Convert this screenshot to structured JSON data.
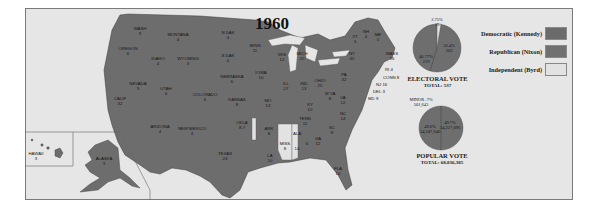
{
  "title": "1960",
  "legend": {
    "items": [
      {
        "label": "Democratic (Kennedy)",
        "color": "#6b6b6b"
      },
      {
        "label": "Republican (Nixon)",
        "color": "#707070"
      },
      {
        "label": "Independent (Byrd)",
        "color": "#e2e2e2"
      }
    ]
  },
  "electoral_vote": {
    "heading": "ELECTORAL VOTE",
    "total_label": "TOTAL: 537",
    "slices": [
      {
        "party": "Independent",
        "percent": "2.75%",
        "votes": "15"
      },
      {
        "party": "Democratic",
        "percent": "56.4%",
        "votes": "303"
      },
      {
        "party": "Republican",
        "percent": "40.77%",
        "votes": "219"
      }
    ]
  },
  "popular_vote": {
    "heading": "POPULAR VOTE",
    "total_label": "TOTAL: 68,836,385",
    "minor_label": "MINOR .7%",
    "minor_votes": "501,643",
    "slices": [
      {
        "party": "Democratic",
        "percent": "49.7%",
        "votes": "34,227,096"
      },
      {
        "party": "Republican",
        "percent": "49.6%",
        "votes": "34,107,646"
      }
    ]
  },
  "states": [
    {
      "name": "WASH",
      "ev": "9"
    },
    {
      "name": "OREGON",
      "ev": "6"
    },
    {
      "name": "CALIF",
      "ev": "32"
    },
    {
      "name": "IDAHO",
      "ev": "4"
    },
    {
      "name": "NEVADA",
      "ev": "3"
    },
    {
      "name": "MONTANA",
      "ev": "4"
    },
    {
      "name": "WYOMING",
      "ev": "3"
    },
    {
      "name": "UTAH",
      "ev": "4"
    },
    {
      "name": "ARIZONA",
      "ev": "4"
    },
    {
      "name": "COLORADO",
      "ev": "6"
    },
    {
      "name": "NEW MEXICO",
      "ev": "4"
    },
    {
      "name": "N DAK",
      "ev": "4"
    },
    {
      "name": "S DAK",
      "ev": "4"
    },
    {
      "name": "NEBRASKA",
      "ev": "6"
    },
    {
      "name": "KANSAS",
      "ev": "8"
    },
    {
      "name": "OKLA",
      "ev": "8-7"
    },
    {
      "name": "TEXAS",
      "ev": "24"
    },
    {
      "name": "MINN",
      "ev": "11"
    },
    {
      "name": "IOWA",
      "ev": "10"
    },
    {
      "name": "MO",
      "ev": "13"
    },
    {
      "name": "ARK",
      "ev": "8"
    },
    {
      "name": "LA",
      "ev": "10"
    },
    {
      "name": "WIS",
      "ev": "12"
    },
    {
      "name": "ILL",
      "ev": "27"
    },
    {
      "name": "MICH",
      "ev": "20"
    },
    {
      "name": "IND",
      "ev": "13"
    },
    {
      "name": "OHIO",
      "ev": "25"
    },
    {
      "name": "KY",
      "ev": "10"
    },
    {
      "name": "TENN",
      "ev": "11"
    },
    {
      "name": "MISS",
      "ev": "8"
    },
    {
      "name": "ALA",
      "ev": "14"
    },
    {
      "name": "GA",
      "ev": "12"
    },
    {
      "name": "FLA",
      "ev": "10"
    },
    {
      "name": "SC",
      "ev": "8"
    },
    {
      "name": "NC",
      "ev": "14"
    },
    {
      "name": "VA",
      "ev": "12"
    },
    {
      "name": "W VA",
      "ev": "8"
    },
    {
      "name": "PA",
      "ev": "32"
    },
    {
      "name": "NY",
      "ev": "45"
    },
    {
      "name": "VT",
      "ev": "3"
    },
    {
      "name": "NH",
      "ev": "4"
    },
    {
      "name": "ME",
      "ev": "5"
    },
    {
      "name": "MASS",
      "ev": "16"
    },
    {
      "name": "RI",
      "ev": "4"
    },
    {
      "name": "CONN",
      "ev": "8"
    },
    {
      "name": "NJ",
      "ev": "16"
    },
    {
      "name": "DEL",
      "ev": "3"
    },
    {
      "name": "MD",
      "ev": "9"
    },
    {
      "name": "HAWAII",
      "ev": "3"
    },
    {
      "name": "ALASKA",
      "ev": "3"
    }
  ],
  "labels": {
    "ala_split": "6",
    "ri": "RI 4",
    "conn": "CONN 8",
    "nj": "NJ 16",
    "del": "DEL 3",
    "md": "MD 9"
  }
}
